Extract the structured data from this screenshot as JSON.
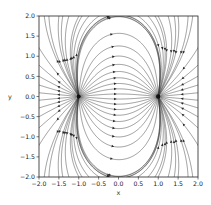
{
  "chart_data": {
    "type": "streamplot",
    "title": "",
    "xlabel": "x",
    "ylabel": "y",
    "xlim": [
      -2.0,
      2.0
    ],
    "ylim": [
      -2.0,
      2.0
    ],
    "xticks": [
      "-2.0",
      "-1.5",
      "-1.0",
      "-0.5",
      "0.0",
      "0.5",
      "1.0",
      "1.5",
      "2.0"
    ],
    "yticks": [
      "-2.0",
      "-1.5",
      "-1.0",
      "-0.5",
      "0.0",
      "0.5",
      "1.0",
      "1.5",
      "2.0"
    ],
    "grid": false,
    "legend": null,
    "field": "electric dipole",
    "charges": [
      {
        "x": -1.0,
        "y": 0.0,
        "sign": "+",
        "role": "source"
      },
      {
        "x": 1.0,
        "y": 0.0,
        "sign": "-",
        "role": "sink"
      }
    ],
    "line_color": "#3a3a3a",
    "marker_color": "#111111"
  },
  "layout": {
    "axes_px": {
      "left": 39,
      "right": 198,
      "top": 16,
      "bottom": 177
    }
  }
}
